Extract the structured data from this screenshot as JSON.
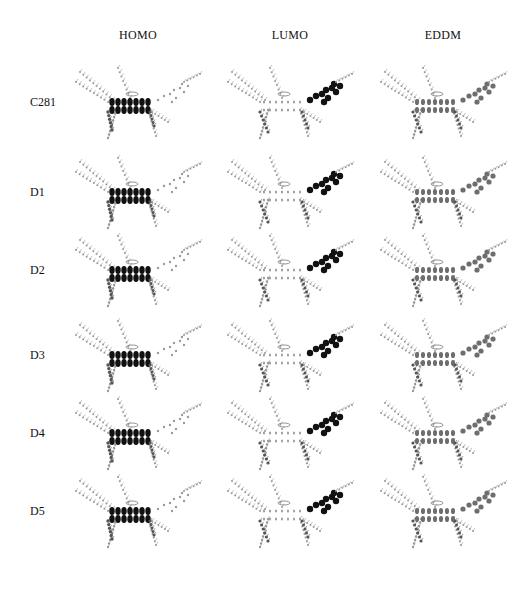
{
  "figure": {
    "columns": [
      {
        "label": "HOMO",
        "x": 138
      },
      {
        "label": "LUMO",
        "x": 290
      },
      {
        "label": "EDDM",
        "x": 443
      }
    ],
    "rows": [
      {
        "label": "C281",
        "y": 102
      },
      {
        "label": "D1",
        "y": 192
      },
      {
        "label": "D2",
        "y": 270
      },
      {
        "label": "D3",
        "y": 355
      },
      {
        "label": "D4",
        "y": 433
      },
      {
        "label": "D5",
        "y": 511
      }
    ],
    "colors": {
      "dark_lobe": "#111111",
      "mid_lobe": "#555555",
      "light_atoms": "#9a9a9a",
      "eddm": "#6e6e6e"
    }
  }
}
